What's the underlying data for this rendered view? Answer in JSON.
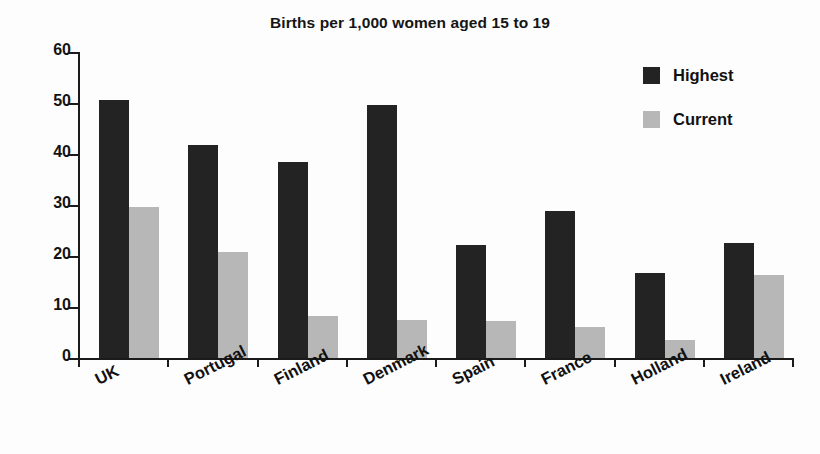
{
  "chart_data": {
    "type": "bar",
    "title": "Births per 1,000 women aged 15 to 19",
    "xlabel": "",
    "ylabel": "",
    "ylim": [
      0,
      60
    ],
    "yticks": [
      0,
      10,
      20,
      30,
      40,
      50,
      60
    ],
    "ytick_labels": [
      "0",
      "10",
      "20",
      "30",
      "40",
      "50",
      "60"
    ],
    "grid": false,
    "legend_position": "top-right",
    "categories": [
      "UK",
      "Portugal",
      "Finland",
      "Denmark",
      "Spain",
      "France",
      "Holland",
      "Ireland"
    ],
    "series": [
      {
        "name": "Highest",
        "color": "#232323",
        "values": [
          50.6,
          41.8,
          38.5,
          49.7,
          22.1,
          28.8,
          16.6,
          22.6
        ]
      },
      {
        "name": "Current",
        "color": "#b7b7b7",
        "values": [
          29.6,
          20.7,
          8.3,
          7.5,
          7.3,
          6.1,
          3.5,
          16.2
        ]
      }
    ]
  }
}
